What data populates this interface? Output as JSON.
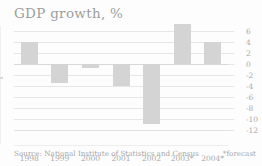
{
  "chart_data": {
    "type": "bar",
    "title": "GDP growth, %",
    "xlabel": "",
    "ylabel": "",
    "categories": [
      "1998",
      "1999",
      "2000",
      "2001",
      "2002",
      "2003*",
      "2004*"
    ],
    "values": [
      4.0,
      -3.5,
      -0.8,
      -4.0,
      -10.9,
      7.3,
      4.0
    ],
    "ylim": [
      -12,
      7.6
    ],
    "yticks": [
      6,
      4,
      2,
      0,
      -2,
      -4,
      -6,
      -8,
      -10,
      -12
    ],
    "ytick_labels": [
      "6",
      "4",
      "2",
      "0",
      "-2",
      "-4",
      "-6",
      "-8",
      "-10",
      "-12"
    ],
    "grid": true,
    "legend": "none",
    "bar_color": "#d4d4d4",
    "gridline_color": "#e6e6e6",
    "text_color": "#a8a8a8",
    "background": "#fdfdfd"
  },
  "source": {
    "text": "Source: National Institute of Statistics and Census"
  },
  "footnote": {
    "text": "*forecast"
  }
}
